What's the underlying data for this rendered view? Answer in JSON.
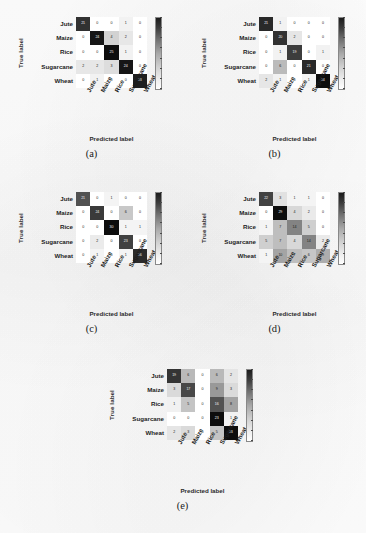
{
  "figure": {
    "axis_titles": {
      "x": "Predicted label",
      "y": "True label"
    },
    "classes": [
      "Jute",
      "Maize",
      "Rice",
      "Sugarcane",
      "Wheat"
    ],
    "colormap": "greys",
    "captions": [
      "(a)",
      "(b)",
      "(c)",
      "(d)",
      "(e)"
    ]
  },
  "chart_data": [
    {
      "type": "heatmap",
      "subplot": "(a)",
      "title": "",
      "xlabel": "Predicted label",
      "ylabel": "True label",
      "categories": [
        "Jute",
        "Maize",
        "Rice",
        "Sugarcane",
        "Wheat"
      ],
      "x": [
        "Jute",
        "Maize",
        "Rice",
        "Sugarcane",
        "Wheat"
      ],
      "y": [
        "Jute",
        "Maize",
        "Rice",
        "Sugarcane",
        "Wheat"
      ],
      "values": [
        [
          21,
          0,
          0,
          1,
          0
        ],
        [
          0,
          24,
          4,
          2,
          0
        ],
        [
          0,
          0,
          25,
          1,
          0
        ],
        [
          2,
          2,
          3,
          24,
          0
        ],
        [
          0,
          1,
          0,
          0,
          23
        ]
      ],
      "vmin": 0,
      "vmax": 25,
      "grid": false,
      "legend": "colorbar-right"
    },
    {
      "type": "heatmap",
      "subplot": "(b)",
      "title": "",
      "xlabel": "Predicted label",
      "ylabel": "True label",
      "categories": [
        "Jute",
        "Maize",
        "Rice",
        "Sugarcane",
        "Wheat"
      ],
      "x": [
        "Jute",
        "Maize",
        "Rice",
        "Sugarcane",
        "Wheat"
      ],
      "y": [
        "Jute",
        "Maize",
        "Rice",
        "Sugarcane",
        "Wheat"
      ],
      "values": [
        [
          21,
          1,
          0,
          0,
          0
        ],
        [
          0,
          20,
          2,
          0,
          0
        ],
        [
          0,
          1,
          19,
          0,
          1
        ],
        [
          0,
          6,
          0,
          21,
          0
        ],
        [
          2,
          1,
          0,
          1,
          24
        ]
      ],
      "vmin": 0,
      "vmax": 24,
      "grid": false,
      "legend": "colorbar-right"
    },
    {
      "type": "heatmap",
      "subplot": "(c)",
      "title": "",
      "xlabel": "Predicted label",
      "ylabel": "True label",
      "categories": [
        "Jute",
        "Maize",
        "Rice",
        "Sugarcane",
        "Wheat"
      ],
      "x": [
        "Jute",
        "Maize",
        "Rice",
        "Sugarcane",
        "Wheat"
      ],
      "y": [
        "Jute",
        "Maize",
        "Rice",
        "Sugarcane",
        "Wheat"
      ],
      "values": [
        [
          21,
          0,
          1,
          0,
          0
        ],
        [
          0,
          24,
          0,
          6,
          0
        ],
        [
          0,
          0,
          30,
          1,
          1
        ],
        [
          0,
          2,
          0,
          23,
          0
        ],
        [
          0,
          1,
          0,
          1,
          26
        ]
      ],
      "vmin": 0,
      "vmax": 30,
      "grid": false,
      "legend": "colorbar-right"
    },
    {
      "type": "heatmap",
      "subplot": "(d)",
      "title": "",
      "xlabel": "Predicted label",
      "ylabel": "True label",
      "categories": [
        "Jute",
        "Maize",
        "Rice",
        "Sugarcane",
        "Wheat"
      ],
      "x": [
        "Jute",
        "Maize",
        "Rice",
        "Sugarcane",
        "Wheat"
      ],
      "y": [
        "Jute",
        "Maize",
        "Rice",
        "Sugarcane",
        "Wheat"
      ],
      "values": [
        [
          22,
          3,
          1,
          1,
          0
        ],
        [
          0,
          29,
          4,
          2,
          0
        ],
        [
          1,
          7,
          14,
          5,
          0
        ],
        [
          5,
          7,
          4,
          14,
          2
        ],
        [
          1,
          10,
          7,
          6,
          9
        ]
      ],
      "vmin": 0,
      "vmax": 29,
      "grid": false,
      "legend": "colorbar-right"
    },
    {
      "type": "heatmap",
      "subplot": "(e)",
      "title": "",
      "xlabel": "Predicted label",
      "ylabel": "True label",
      "categories": [
        "Jute",
        "Maize",
        "Rice",
        "Sugarcane",
        "Wheat"
      ],
      "x": [
        "Jute",
        "Maize",
        "Rice",
        "Sugarcane",
        "Wheat"
      ],
      "y": [
        "Jute",
        "Maize",
        "Rice",
        "Sugarcane",
        "Wheat"
      ],
      "values": [
        [
          19,
          6,
          0,
          6,
          2
        ],
        [
          3,
          17,
          0,
          9,
          3
        ],
        [
          1,
          5,
          0,
          16,
          8
        ],
        [
          0,
          0,
          0,
          23,
          1
        ],
        [
          2,
          3,
          0,
          5,
          23
        ]
      ],
      "vmin": 0,
      "vmax": 23,
      "grid": false,
      "legend": "colorbar-right"
    }
  ]
}
